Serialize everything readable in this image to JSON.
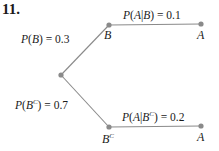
{
  "problem_number": "11.",
  "colors": {
    "edge": "#8a8a8a",
    "node": "#8a8a8a",
    "text": "#1a1a1a"
  },
  "nodes": {
    "root": {
      "label": ""
    },
    "B": {
      "label": "B"
    },
    "Bc": {
      "label": "B",
      "sup": "C"
    },
    "A_top": {
      "label": "A"
    },
    "A_bottom": {
      "label": "A"
    }
  },
  "edges": [
    {
      "from": "root",
      "to": "B",
      "label": {
        "fn": "P",
        "open": "(",
        "var": "B",
        "close": ")",
        "eq": " = ",
        "value": "0.3"
      }
    },
    {
      "from": "root",
      "to": "Bc",
      "label": {
        "fn": "P",
        "open": "(",
        "var": "B",
        "sup": "C",
        "close": ")",
        "eq": " = ",
        "value": "0.7"
      }
    },
    {
      "from": "B",
      "to": "A_top",
      "label": {
        "fn": "P",
        "open": "(",
        "var": "A",
        "bar": "|",
        "given": "B",
        "close": ")",
        "eq": " = ",
        "value": "0.1"
      }
    },
    {
      "from": "Bc",
      "to": "A_bottom",
      "label": {
        "fn": "P",
        "open": "(",
        "var": "A",
        "bar": "|",
        "given": "B",
        "sup": "C",
        "close": ")",
        "eq": " = ",
        "value": "0.2"
      }
    }
  ]
}
